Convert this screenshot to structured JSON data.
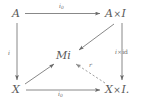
{
  "figure": {
    "type": "commutative-diagram",
    "background_color": "#ffffff",
    "ink_color": "#6a6a6a",
    "nodes": [
      {
        "id": "top-left",
        "label": "A",
        "x": 12,
        "y": 8
      },
      {
        "id": "top-right",
        "label": "A × I",
        "x": 105,
        "y": 8
      },
      {
        "id": "center",
        "label": "Mi",
        "x": 56,
        "y": 50
      },
      {
        "id": "bottom-left",
        "label": "X",
        "x": 12,
        "y": 84
      },
      {
        "id": "bottom-right",
        "label": "X × I.",
        "x": 105,
        "y": 84
      }
    ],
    "node_parts": {
      "A": "A",
      "A_times_I_left": "A",
      "A_times_I_times": "×",
      "A_times_I_right": "I",
      "Mi": "Mi",
      "X": "X",
      "X_times_I_left": "X",
      "X_times_I_times": "×",
      "X_times_I_right": "I."
    },
    "edges": [
      {
        "id": "top",
        "from": "A",
        "to": "A × I",
        "label": "i₀",
        "style": "solid",
        "label_x": 59,
        "label_y": 4
      },
      {
        "id": "left",
        "from": "A",
        "to": "X",
        "label": "i",
        "style": "solid",
        "label_x": 8,
        "label_y": 51
      },
      {
        "id": "right",
        "from": "A × I",
        "to": "X × I.",
        "label": "i × id",
        "style": "solid",
        "label_x": 115,
        "label_y": 50
      },
      {
        "id": "bottom",
        "from": "X",
        "to": "X × I.",
        "label": "i₀",
        "style": "solid",
        "label_x": 58,
        "label_y": 92
      },
      {
        "id": "diagonal-top",
        "from": "A × I",
        "to": "Mi",
        "label": "",
        "style": "solid",
        "label_x": 0,
        "label_y": 0
      },
      {
        "id": "diagonal-bot",
        "from": "X",
        "to": "Mi",
        "label": "",
        "style": "solid",
        "label_x": 0,
        "label_y": 0
      },
      {
        "id": "retraction",
        "from": "X × I.",
        "to": "Mi",
        "label": "r",
        "style": "dashed",
        "label_x": 89,
        "label_y": 63
      }
    ],
    "edge_labels": {
      "top_i": "i",
      "top_sub": "0",
      "left_i": "i",
      "right_i": "i",
      "right_times": "×",
      "right_id": "id",
      "bottom_i": "i",
      "bottom_sub": "0",
      "retraction_r": "r"
    }
  }
}
